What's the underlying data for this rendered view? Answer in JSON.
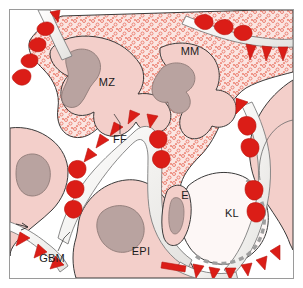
{
  "figure": {
    "kind": "anatomical-diagram",
    "frame_border_color": "#9a9a9a",
    "background_color": "#ffffff"
  },
  "palette": {
    "cytoplasm_pink": "#f3cfca",
    "cytoplasm_pink_dark": "#eec0ba",
    "mesangial_stipple_bg": "#fbe4e0",
    "stipple_dot": "#e8796a",
    "nucleus_gray": "#b9a3a0",
    "nucleus_outline": "#8e7a77",
    "deposit_red": "#db1d17",
    "deposit_red_dark": "#b8150f",
    "basement_membrane": "#f4f4f2",
    "basement_membrane_line": "#7d7d7d",
    "lumen_white": "#fdf7f6",
    "outline": "#3a3a3a",
    "dashed_endothelium": "#9e9e9e",
    "label_text": "#1b1b1b"
  },
  "labels": [
    {
      "id": "mz",
      "text": "MZ",
      "x": 97,
      "y": 76,
      "meaning": "mesangial zone",
      "has_leader": false
    },
    {
      "id": "mm",
      "text": "MM",
      "x": 180,
      "y": 45,
      "meaning": "mesangial matrix",
      "has_leader": false
    },
    {
      "id": "ff",
      "text": "FF",
      "x": 110,
      "y": 131,
      "meaning": "foot processes / filtration",
      "has_leader": true
    },
    {
      "id": "e",
      "text": "E",
      "x": 175,
      "y": 189,
      "meaning": "endothelial cell",
      "has_leader": false
    },
    {
      "id": "kl",
      "text": "KL",
      "x": 222,
      "y": 206,
      "meaning": "capillary lumen",
      "has_leader": false
    },
    {
      "id": "epi",
      "text": "EPI",
      "x": 131,
      "y": 243,
      "meaning": "epithelial cell (podocyte)",
      "has_leader": false
    },
    {
      "id": "gbm",
      "text": "GBM",
      "x": 40,
      "y": 248,
      "meaning": "glomerular basement membrane",
      "has_leader": true
    }
  ]
}
